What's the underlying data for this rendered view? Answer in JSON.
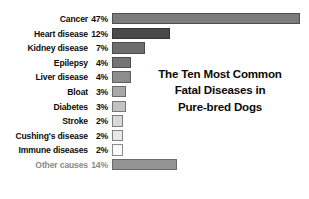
{
  "chart_data": {
    "type": "bar",
    "orientation": "horizontal",
    "title": "The Ten Most Common Fatal Diseases in Pure-bred Dogs",
    "title_lines": [
      "The Ten Most Common",
      "Fatal Diseases in",
      "Pure-bred Dogs"
    ],
    "xlabel": "",
    "ylabel": "",
    "grid": false,
    "legend": "none",
    "value_suffix": "%",
    "categories": [
      "Cancer",
      "Heart disease",
      "Kidney disease",
      "Epilepsy",
      "Liver disease",
      "Bloat",
      "Diabetes",
      "Stroke",
      "Cushing's disease",
      "Immune diseases",
      "Other causes"
    ],
    "values": [
      47,
      12,
      7,
      4,
      4,
      3,
      3,
      2,
      2,
      2,
      14
    ],
    "value_labels": [
      "47%",
      "12%",
      "7%",
      "4%",
      "4%",
      "3%",
      "3%",
      "2%",
      "2%",
      "2%",
      "14%"
    ],
    "bars": [
      {
        "label": "Cancer",
        "value": 47,
        "value_label": "47%",
        "bar_px": 188,
        "fill": "#7c7c7c",
        "border": "#4f4f4f",
        "muted": false
      },
      {
        "label": "Heart disease",
        "value": 12,
        "value_label": "12%",
        "bar_px": 58,
        "fill": "#4a4a4a",
        "border": "#353535",
        "muted": false
      },
      {
        "label": "Kidney disease",
        "value": 7,
        "value_label": "7%",
        "bar_px": 33,
        "fill": "#6d6d6d",
        "border": "#4a4a4a",
        "muted": false
      },
      {
        "label": "Epilepsy",
        "value": 4,
        "value_label": "4%",
        "bar_px": 19,
        "fill": "#747474",
        "border": "#4f4f4f",
        "muted": false
      },
      {
        "label": "Liver disease",
        "value": 4,
        "value_label": "4%",
        "bar_px": 19,
        "fill": "#8d8d8d",
        "border": "#5e5e5e",
        "muted": false
      },
      {
        "label": "Bloat",
        "value": 3,
        "value_label": "3%",
        "bar_px": 14,
        "fill": "#a8a8a8",
        "border": "#6b6b6b",
        "muted": false
      },
      {
        "label": "Diabetes",
        "value": 3,
        "value_label": "3%",
        "bar_px": 14,
        "fill": "#c2c2c2",
        "border": "#777777",
        "muted": false
      },
      {
        "label": "Stroke",
        "value": 2,
        "value_label": "2%",
        "bar_px": 11,
        "fill": "#d8d8d8",
        "border": "#7e7e7e",
        "muted": false
      },
      {
        "label": "Cushing's disease",
        "value": 2,
        "value_label": "2%",
        "bar_px": 11,
        "fill": "#e8e8e8",
        "border": "#848484",
        "muted": false
      },
      {
        "label": "Immune diseases",
        "value": 2,
        "value_label": "2%",
        "bar_px": 11,
        "fill": "#fbfbfb",
        "border": "#8a8a8a",
        "muted": false
      },
      {
        "label": "Other causes",
        "value": 14,
        "value_label": "14%",
        "bar_px": 65,
        "fill": "#939393",
        "border": "#6a6a6a",
        "muted": true
      }
    ]
  },
  "colors": {
    "background": "#ffffff",
    "label_text": "#0d0d0d",
    "muted_text": "#8a8a8a",
    "title_text": "#0a0a0a"
  }
}
